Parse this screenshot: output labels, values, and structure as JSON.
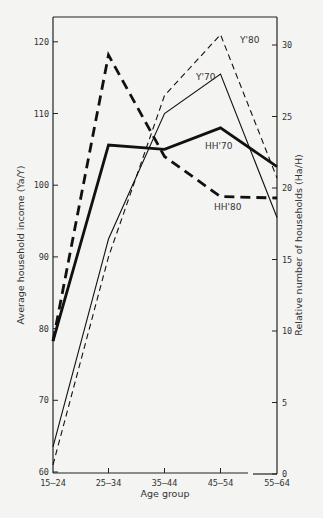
{
  "chart_data": {
    "type": "line",
    "title": "",
    "xlabel": "Age group",
    "ylabel": "Average household income (Ya/Y)",
    "ylabel_right": "Relative number of households (Ha/H)",
    "categories": [
      "15-24",
      "25-34",
      "35-44",
      "45-54",
      "55-64"
    ],
    "category_labels": [
      "15–24",
      "25–34",
      "35–44",
      "45–54",
      "55–64"
    ],
    "ylim": [
      60,
      123
    ],
    "ylim_right": [
      0,
      31.5
    ],
    "yticks": [
      60,
      70,
      80,
      90,
      100,
      110,
      120
    ],
    "yticks_right": [
      0,
      5,
      10,
      15,
      20,
      25,
      30
    ],
    "grid": false,
    "series": [
      {
        "name": "Y'70",
        "axis": "left",
        "style": "thin-solid",
        "values": [
          63.5,
          92.5,
          110,
          115.5,
          95.5
        ]
      },
      {
        "name": "Y'80",
        "axis": "left",
        "style": "thin-dashed",
        "values": [
          61,
          90,
          112.5,
          121,
          101
        ]
      },
      {
        "name": "HH'70",
        "axis": "right",
        "style": "thick-solid",
        "values": [
          9.3,
          23.0,
          22.7,
          24.2,
          21.5
        ]
      },
      {
        "name": "HH'80",
        "axis": "right",
        "style": "thick-dashed",
        "values": [
          9.3,
          29.3,
          22.2,
          19.4,
          19.3
        ]
      }
    ],
    "annotations": [
      {
        "text": "Y'80",
        "x": 240,
        "y": 43
      },
      {
        "text": "Y'70",
        "x": 196,
        "y": 80
      },
      {
        "text": "HH'70",
        "x": 205,
        "y": 149
      },
      {
        "text": "HH'80",
        "x": 214,
        "y": 210
      }
    ]
  }
}
